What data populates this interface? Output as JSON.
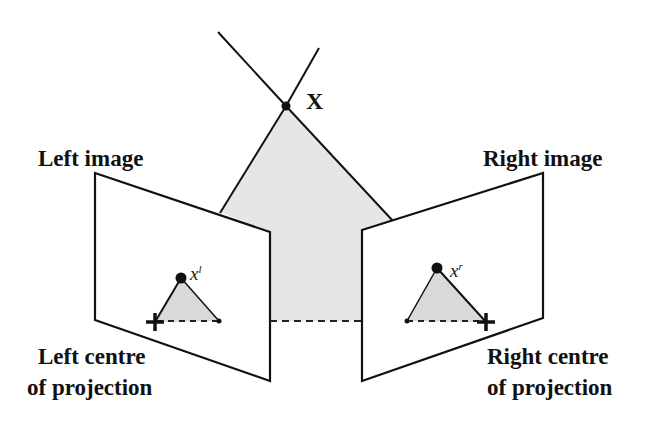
{
  "diagram": {
    "type": "stereo-triangulation",
    "point_label": "X",
    "left": {
      "image_label": "Left image",
      "centre_label_line1": "Left centre",
      "centre_label_line2": "of projection",
      "projected_point_base": "x",
      "projected_point_prime": "l"
    },
    "right": {
      "image_label": "Right image",
      "centre_label_line1": "Right centre",
      "centre_label_line2": "of projection",
      "projected_point_base": "x",
      "projected_point_prime": "r"
    },
    "colors": {
      "line": "#111111",
      "shade": "#e6e6e6",
      "inner_shade": "#d9d9d9",
      "background": "#ffffff"
    }
  }
}
